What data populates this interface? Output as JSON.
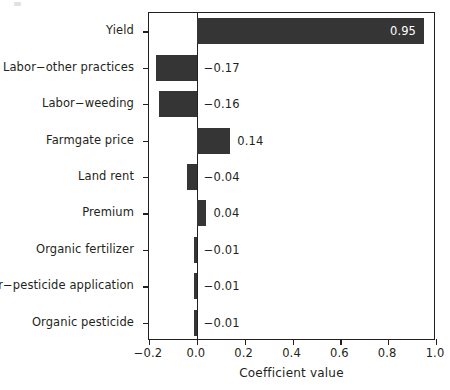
{
  "chart_data": {
    "type": "bar",
    "orientation": "horizontal",
    "title": "",
    "xlabel": "Coefficient value",
    "ylabel": "",
    "xlim": [
      -0.2,
      1.0
    ],
    "xticks": [
      -0.2,
      0.0,
      0.2,
      0.4,
      0.6,
      0.8,
      1.0
    ],
    "xticklabels": [
      "−0.2",
      "0.0",
      "0.2",
      "0.4",
      "0.6",
      "0.8",
      "1.0"
    ],
    "grid": false,
    "legend": null,
    "zero_reference_line": 0.0,
    "bar_color": "#353535",
    "categories": [
      "Yield",
      "Labor−other practices",
      "Labor−weeding",
      "Farmgate price",
      "Land rent",
      "Premium",
      "Organic fertilizer",
      "Labor−pesticide application",
      "Organic pesticide"
    ],
    "values": [
      0.95,
      -0.17,
      -0.16,
      0.14,
      -0.04,
      0.04,
      -0.01,
      -0.01,
      -0.01
    ],
    "value_labels": [
      "0.95",
      "−0.17",
      "−0.16",
      "0.14",
      "−0.04",
      "0.04",
      "−0.01",
      "−0.01",
      "−0.01"
    ],
    "label_placement": [
      "inside-end",
      "right-of-zero",
      "right-of-zero",
      "right-of-bar",
      "right-of-zero",
      "right-of-bar",
      "right-of-zero",
      "right-of-zero",
      "right-of-zero"
    ]
  },
  "axes": {
    "x_axis_title": "Coefficient value"
  }
}
